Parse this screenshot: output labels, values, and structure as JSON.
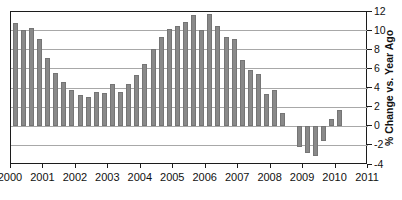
{
  "chart_data": {
    "type": "bar",
    "title": "",
    "xlabel": "",
    "ylabel": "% Change vs. Year Ago",
    "x_unit": "quarterly",
    "quarters": [
      "2000Q1",
      "2000Q2",
      "2000Q3",
      "2000Q4",
      "2001Q1",
      "2001Q2",
      "2001Q3",
      "2001Q4",
      "2002Q1",
      "2002Q2",
      "2002Q3",
      "2002Q4",
      "2003Q1",
      "2003Q2",
      "2003Q3",
      "2003Q4",
      "2004Q1",
      "2004Q2",
      "2004Q3",
      "2004Q4",
      "2005Q1",
      "2005Q2",
      "2005Q3",
      "2005Q4",
      "2006Q1",
      "2006Q2",
      "2006Q3",
      "2006Q4",
      "2007Q1",
      "2007Q2",
      "2007Q3",
      "2007Q4",
      "2008Q1",
      "2008Q2",
      "2008Q3",
      "2008Q4",
      "2009Q1",
      "2009Q2",
      "2009Q3",
      "2009Q4",
      "2010Q1"
    ],
    "values": [
      10.7,
      10.0,
      10.2,
      9.1,
      7.1,
      5.5,
      4.6,
      3.7,
      3.2,
      3.0,
      3.5,
      3.4,
      4.4,
      3.5,
      4.4,
      5.3,
      6.5,
      8.0,
      9.3,
      10.1,
      10.4,
      10.8,
      11.6,
      10.0,
      11.7,
      10.4,
      9.3,
      9.1,
      6.9,
      5.8,
      5.4,
      3.3,
      3.7,
      1.3,
      0.0,
      -2.2,
      -2.9,
      -3.2,
      -1.6,
      0.7,
      1.6
    ],
    "xticks": [
      "2000",
      "2001",
      "2002",
      "2003",
      "2004",
      "2005",
      "2006",
      "2007",
      "2008",
      "2009",
      "2010",
      "2011"
    ],
    "yticks": [
      "12",
      "10",
      "8",
      "6",
      "4",
      "2",
      "0",
      "-2",
      "-4"
    ],
    "ytick_values": [
      12,
      10,
      8,
      6,
      4,
      2,
      0,
      -2,
      -4
    ],
    "ylim": [
      -4,
      12
    ],
    "xlim_years": [
      2000,
      2011
    ],
    "grid": true,
    "legend": "none",
    "bar_color": "#898989",
    "grid_color": "#a8a8a8",
    "frame_color": "#1c1c1c"
  },
  "layout_px": {
    "plot_left": 10,
    "plot_top": 11,
    "plot_width": 357,
    "plot_height": 153
  }
}
